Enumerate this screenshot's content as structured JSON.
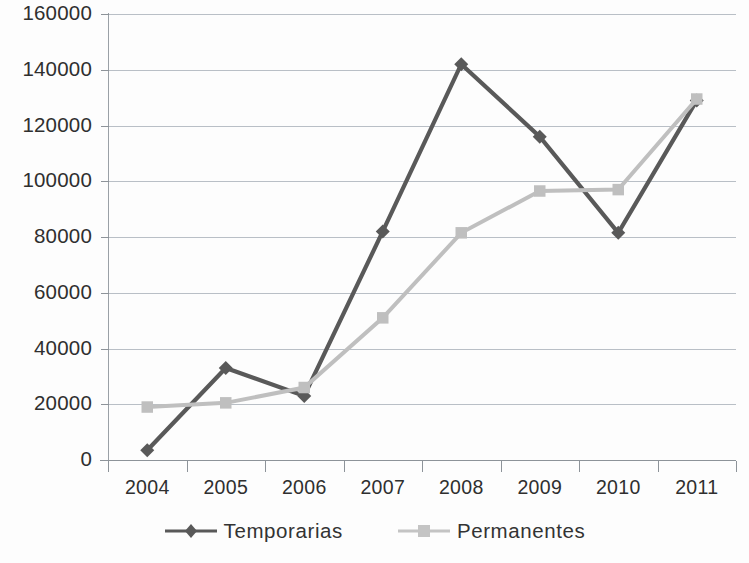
{
  "chart_data": {
    "type": "line",
    "title": "",
    "subtitle": "",
    "xlabel": "",
    "ylabel": "",
    "categories": [
      "2004",
      "2005",
      "2006",
      "2007",
      "2008",
      "2009",
      "2010",
      "2011"
    ],
    "x_tick_labels": [
      "2004",
      "2005",
      "2006",
      "2007",
      "2008",
      "2009",
      "2010",
      "2011"
    ],
    "y_tick_labels": [
      "0",
      "20000",
      "40000",
      "60000",
      "80000",
      "100000",
      "120000",
      "140000",
      "160000"
    ],
    "y_tick_values": [
      0,
      20000,
      40000,
      60000,
      80000,
      100000,
      120000,
      140000,
      160000
    ],
    "ylim": [
      0,
      160000
    ],
    "y_tick_step": 20000,
    "grid": "horizontal",
    "legend_position": "bottom",
    "series": [
      {
        "name": "Temporarias",
        "color": "#595959",
        "marker": "diamond",
        "values": [
          3500,
          33000,
          23000,
          82000,
          142000,
          116000,
          81500,
          129000
        ]
      },
      {
        "name": "Permanentes",
        "color": "#bfbfbf",
        "marker": "square",
        "values": [
          19000,
          20500,
          26000,
          51000,
          81500,
          96500,
          97000,
          129500
        ]
      }
    ]
  },
  "legend": {
    "items": [
      {
        "label": "Temporarias",
        "color": "#595959",
        "marker": "diamond"
      },
      {
        "label": "Permanentes",
        "color": "#bfbfbf",
        "marker": "square"
      }
    ]
  },
  "axes": {
    "y_labels": [
      "160000",
      "140000",
      "120000",
      "100000",
      "80000",
      "60000",
      "40000",
      "20000",
      "0"
    ],
    "x_labels": [
      "2004",
      "2005",
      "2006",
      "2007",
      "2008",
      "2009",
      "2010",
      "2011"
    ]
  }
}
